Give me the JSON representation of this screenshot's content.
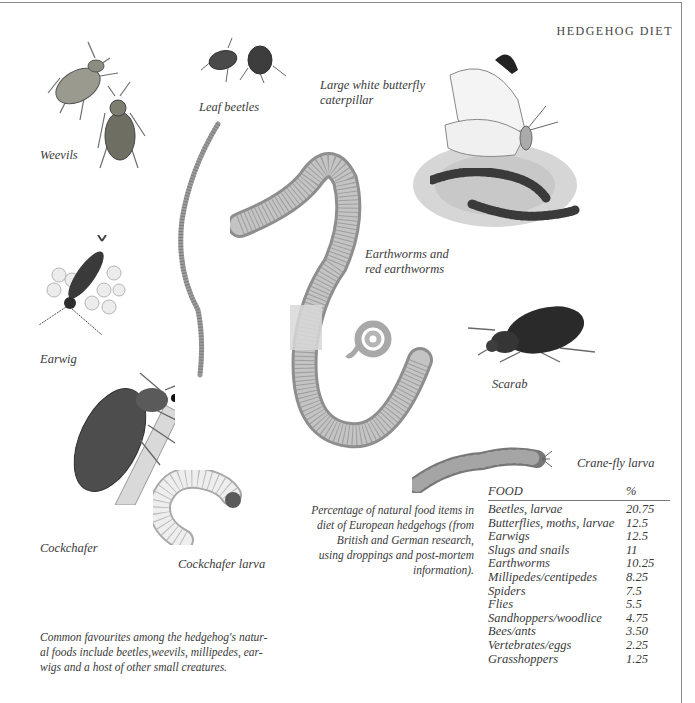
{
  "page": {
    "title": "HEDGEHOG DIET"
  },
  "labels": {
    "weevils": "Weevils",
    "leaf_beetles": "Leaf beetles",
    "butterfly_line1": "Large white butterfly",
    "butterfly_line2": "caterpillar",
    "earthworms_line1": "Earthworms and",
    "earthworms_line2": "red earthworms",
    "earwig": "Earwig",
    "scarab": "Scarab",
    "cockchafer": "Cockchafer",
    "cockchafer_larva": "Cockchafer larva",
    "crane_fly_larva": "Crane-fly larva"
  },
  "captions": {
    "table_caption": [
      "Percentage of natural food items in",
      "diet of European hedgehogs (from",
      "British and German research,",
      "using droppings and post-mortem",
      "information)."
    ],
    "intro": [
      "Common favourites among the hedgehog's natur-",
      "al foods include beetles,weevils, millipedes, ear-",
      "wigs and a host of other small creatures."
    ]
  },
  "table": {
    "headers": [
      "FOOD",
      "%"
    ],
    "rows": [
      {
        "food": "Beetles, larvae",
        "pct": "20.75"
      },
      {
        "food": "Butterflies, moths, larvae",
        "pct": "12.5"
      },
      {
        "food": "Earwigs",
        "pct": "12.5"
      },
      {
        "food": "Slugs and snails",
        "pct": "11"
      },
      {
        "food": "Earthworms",
        "pct": "10.25"
      },
      {
        "food": "Millipedes/centipedes",
        "pct": "8.25"
      },
      {
        "food": "Spiders",
        "pct": "7.5"
      },
      {
        "food": "Flies",
        "pct": "5.5"
      },
      {
        "food": "Sandhoppers/woodlice",
        "pct": "4.75"
      },
      {
        "food": "Bees/ants",
        "pct": "3.50"
      },
      {
        "food": "Vertebrates/eggs",
        "pct": "2.25"
      },
      {
        "food": "Grasshoppers",
        "pct": "1.25"
      }
    ]
  },
  "illustrations": [
    "weevil-icon",
    "leaf-beetle-icon",
    "butterfly-icon",
    "caterpillar-icon",
    "thin-worm-icon",
    "earthworm-icon",
    "coiled-worm-icon",
    "earwig-icon",
    "scarab-icon",
    "cockchafer-icon",
    "cockchafer-larva-icon",
    "crane-fly-larva-icon"
  ]
}
